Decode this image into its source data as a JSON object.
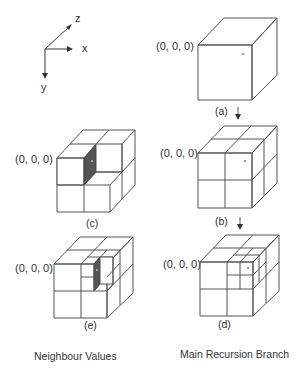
{
  "axes": {
    "z_label": "z",
    "x_label": "x",
    "y_label": "y"
  },
  "origin_label": "(0, 0, 0)",
  "panels": {
    "a": {
      "caption": "(a)",
      "description": "Whole cube, single cell"
    },
    "b": {
      "caption": "(b)",
      "description": "Cube subdivided into 2x2x2 octants"
    },
    "c": {
      "caption": "(c)",
      "description": "2x2x2 cube with top-front-right octant removed, neighbour face shaded"
    },
    "d": {
      "caption": "(d)",
      "description": "Top-front-right octant further subdivided 2x2x2"
    },
    "e": {
      "caption": "(e)",
      "description": "Second level with one sub-octant removed, neighbour face shaded"
    }
  },
  "columns": {
    "left": "Neighbour Values",
    "right": "Main Recursion Branch"
  },
  "colors": {
    "line": "#555555",
    "shade": "#555555",
    "background": "#ffffff"
  }
}
